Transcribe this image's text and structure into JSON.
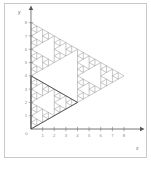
{
  "figure": {
    "background_color": "#ffffff",
    "frame_color": "#c9c9c9",
    "caption": ""
  },
  "axes": {
    "x_axis_label": "x",
    "y_axis_label": "y",
    "axis_color": "#555555",
    "tick_color": "#777777",
    "x_range": [
      -0.6,
      9.2
    ],
    "y_range": [
      -0.6,
      8.8
    ],
    "x_ticks": [
      {
        "value": 1,
        "label": "1"
      },
      {
        "value": 2,
        "label": "2"
      },
      {
        "value": 3,
        "label": "3"
      },
      {
        "value": 4,
        "label": "4"
      },
      {
        "value": 5,
        "label": "5"
      },
      {
        "value": 6,
        "label": "6"
      },
      {
        "value": 7,
        "label": "7"
      },
      {
        "value": 8,
        "label": "8"
      }
    ],
    "y_ticks": [
      {
        "value": 1,
        "label": "1"
      },
      {
        "value": 2,
        "label": "2"
      },
      {
        "value": 3,
        "label": "3"
      },
      {
        "value": 4,
        "label": "4"
      },
      {
        "value": 5,
        "label": "5"
      },
      {
        "value": 6,
        "label": "6"
      },
      {
        "value": 7,
        "label": "7"
      },
      {
        "value": 8,
        "label": "8"
      }
    ],
    "origin_label": "0"
  },
  "chart_data": {
    "type": "line",
    "title": "",
    "xlabel": "x",
    "ylabel": "y",
    "xlim": [
      -0.6,
      9.2
    ],
    "ylim": [
      -0.6,
      8.8
    ],
    "grid": false,
    "legend": null,
    "fractal": {
      "name": "sierpinski-triangle",
      "vertices": [
        [
          0,
          0
        ],
        [
          0,
          8
        ],
        [
          8,
          4
        ]
      ],
      "depth": 4,
      "stroke_color": "#9a9a9a",
      "highlight_stroke_color": "#4a4a4a",
      "highlight_region": "lower-left",
      "fill": "none"
    },
    "series": [
      {
        "name": "outer-triangle",
        "x": [
          0,
          0,
          8,
          0
        ],
        "y": [
          0,
          8,
          4,
          0
        ]
      }
    ]
  }
}
